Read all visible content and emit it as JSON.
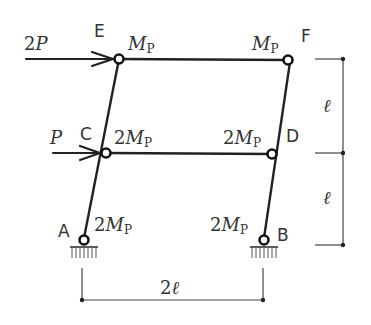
{
  "diagram": {
    "type": "structural-frame",
    "nodes": {
      "A": {
        "label": "A",
        "support": "pin"
      },
      "B": {
        "label": "B",
        "support": "pin"
      },
      "C": {
        "label": "C",
        "joint": "hinge"
      },
      "D": {
        "label": "D",
        "joint": "hinge"
      },
      "E": {
        "label": "E",
        "joint": "hinge"
      },
      "F": {
        "label": "F",
        "joint": "hinge"
      }
    },
    "loads": {
      "top": {
        "coef": "2",
        "symbol": "P",
        "at": "E",
        "direction": "right"
      },
      "middle": {
        "coef": "",
        "symbol": "P",
        "at": "C",
        "direction": "right"
      }
    },
    "plastic_moments": {
      "E": {
        "coef": "",
        "symbol": "M",
        "sub": "P"
      },
      "F": {
        "coef": "",
        "symbol": "M",
        "sub": "P"
      },
      "C": {
        "coef": "2",
        "symbol": "M",
        "sub": "P"
      },
      "D": {
        "coef": "2",
        "symbol": "M",
        "sub": "P"
      },
      "A": {
        "coef": "2",
        "symbol": "M",
        "sub": "P"
      },
      "B": {
        "coef": "2",
        "symbol": "M",
        "sub": "P"
      }
    },
    "dimensions": {
      "upper_height": "ℓ",
      "lower_height": "ℓ",
      "width_coef": "2",
      "width_symbol": "ℓ"
    }
  }
}
